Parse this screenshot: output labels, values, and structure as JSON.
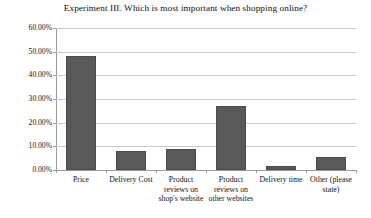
{
  "chart_data": {
    "type": "bar",
    "title": "Experiment III. Which is most important when shopping online?",
    "xlabel": "",
    "ylabel": "",
    "categories": [
      "Price",
      "Delivery Cost",
      "Product reviews on shop's website",
      "Product reviews on other websites",
      "Delivery time",
      "Other (please state)"
    ],
    "values": [
      48.0,
      8.0,
      9.0,
      27.0,
      1.5,
      5.5
    ],
    "value_labels": [
      "48.00%",
      "8.00%",
      "9.00%",
      "27.00%",
      "1.50%",
      "5.50%"
    ],
    "ylim": [
      0,
      60
    ],
    "ytick_values": [
      0,
      10,
      20,
      30,
      40,
      50,
      60
    ],
    "ytick_labels": [
      "0.00%",
      "10.00%",
      "20.00%",
      "30.00%",
      "40.00%",
      "50.00%",
      "60.00%"
    ],
    "grid": true,
    "legend": false,
    "legend_position": "none",
    "bar_color": "#595959",
    "gridline_color": "#c9c9c9",
    "axis_color": "#9a9a9a",
    "background_color": "#ffffff"
  },
  "categories_wrapped": [
    [
      "Price"
    ],
    [
      "Delivery Cost"
    ],
    [
      "Product",
      "reviews on",
      "shop's website"
    ],
    [
      "Product",
      "reviews on",
      "other websites"
    ],
    [
      "Delivery time"
    ],
    [
      "Other (please",
      "state)"
    ]
  ]
}
